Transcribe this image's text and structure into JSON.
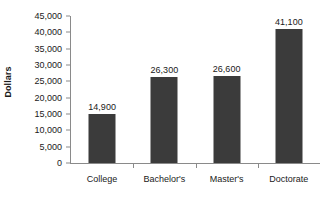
{
  "chart_data": {
    "type": "bar",
    "title": "",
    "xlabel": "",
    "ylabel": "Dollars",
    "categories": [
      "College",
      "Bachelor's",
      "Master's",
      "Doctorate"
    ],
    "values": [
      14900,
      26300,
      26600,
      41100
    ],
    "value_labels": [
      "14,900",
      "26,300",
      "26,600",
      "41,100"
    ],
    "ylim": [
      0,
      45000
    ],
    "ytick_values": [
      0,
      5000,
      10000,
      15000,
      20000,
      25000,
      30000,
      35000,
      40000,
      45000
    ],
    "ytick_labels": [
      "0",
      "5,000",
      "10,000",
      "15,000",
      "20,000",
      "25,000",
      "30,000",
      "35,000",
      "40,000",
      "45,000"
    ],
    "grid": false,
    "legend": false,
    "bar_color": "#3b3b3b",
    "axis_color": "#8a8a8a",
    "text_color": "#1a1a1a",
    "background": "#ffffff"
  }
}
